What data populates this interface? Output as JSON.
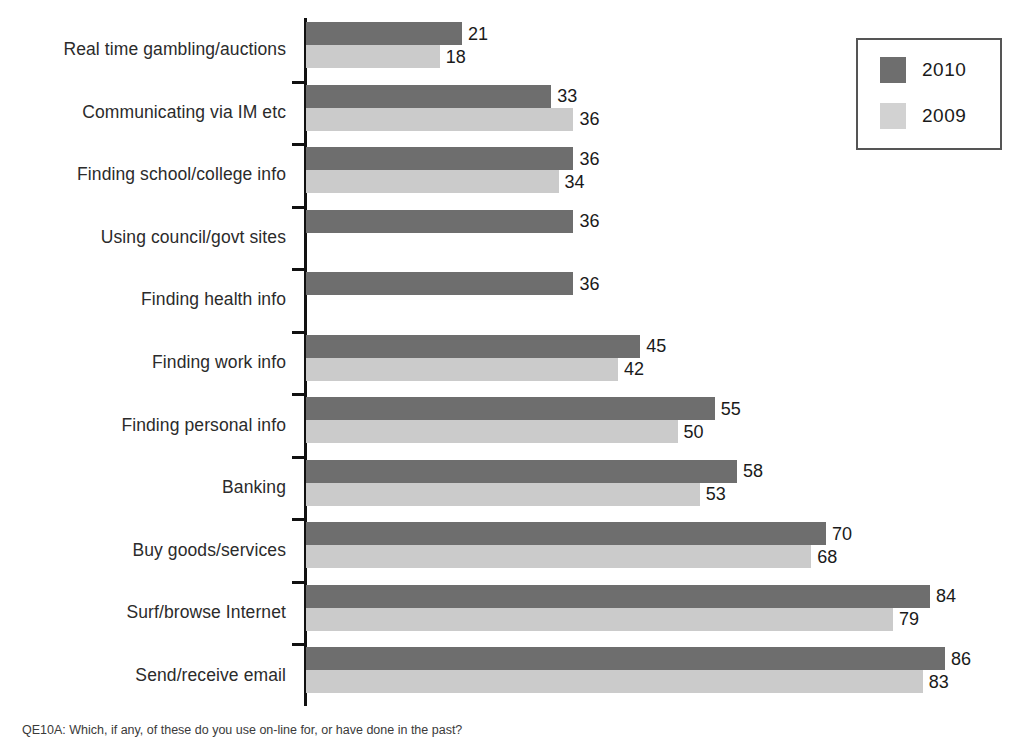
{
  "chart_data": {
    "type": "bar",
    "orientation": "horizontal",
    "title": "",
    "xlabel": "",
    "ylabel": "",
    "xlim": [
      0,
      90
    ],
    "grid": false,
    "legend_position": "top-right",
    "categories": [
      "Real time gambling/auctions",
      "Communicating via IM etc",
      "Finding school/college info",
      "Using council/govt sites",
      "Finding health info",
      "Finding work info",
      "Finding personal info",
      "Banking",
      "Buy goods/services",
      "Surf/browse Internet",
      "Send/receive email"
    ],
    "series": [
      {
        "name": "2010",
        "color": "#6e6e6e",
        "values": [
          21,
          33,
          36,
          36,
          36,
          45,
          55,
          58,
          70,
          84,
          86
        ],
        "labels": [
          "21",
          "33",
          "36",
          "36",
          "36",
          "45",
          "55",
          "58",
          "70",
          "84",
          "86"
        ]
      },
      {
        "name": "2009",
        "color": "#cbcbcb",
        "values": [
          18,
          36,
          34,
          null,
          null,
          42,
          50,
          53,
          68,
          79,
          83
        ],
        "labels": [
          "18",
          "36",
          "34",
          "",
          "",
          "42",
          "50",
          "53",
          "68",
          "79",
          "83"
        ]
      }
    ]
  },
  "legend": {
    "items": [
      {
        "label": "2010",
        "color": "#6e6e6e"
      },
      {
        "label": "2009",
        "color": "#d2d2d2"
      }
    ]
  },
  "caption": {
    "text": "QE10A: Which, if any, of these do you use on-line for, or have done in the past?"
  }
}
